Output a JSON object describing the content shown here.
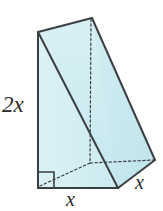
{
  "figure": {
    "kind": "triangular-prism-wedge",
    "colors": {
      "face_fill": "#cdebf0",
      "face_fill_light": "#dcf2f5",
      "face_fill_dark": "#bfe4eb",
      "outline": "#3a3f42",
      "hidden_edge": "#3a3f42",
      "background": "#ffffff",
      "label_text": "#2b2b2b"
    },
    "labels": {
      "height": "2x",
      "base": "x",
      "depth": "x"
    },
    "markers": {
      "right_angle": "right-angle-square"
    },
    "vertices": {
      "front_top_left": [
        38,
        32
      ],
      "front_bottom_left": [
        38,
        188
      ],
      "front_bottom_right": [
        118,
        188
      ],
      "back_top": [
        92,
        18
      ],
      "back_bottom_right": [
        155,
        160
      ],
      "hidden_back_bottom_left": [
        90,
        163
      ]
    },
    "edges": {
      "solid": [
        "front_top_left -> front_bottom_left",
        "front_bottom_left -> front_bottom_right",
        "front_bottom_right -> back_bottom_right",
        "back_bottom_right -> back_top",
        "back_top -> front_top_left",
        "front_top_left -> front_bottom_right"
      ],
      "dashed": [
        "back_top -> hidden_back_bottom_left",
        "hidden_back_bottom_left -> front_bottom_left",
        "hidden_back_bottom_left -> back_bottom_right"
      ]
    }
  }
}
